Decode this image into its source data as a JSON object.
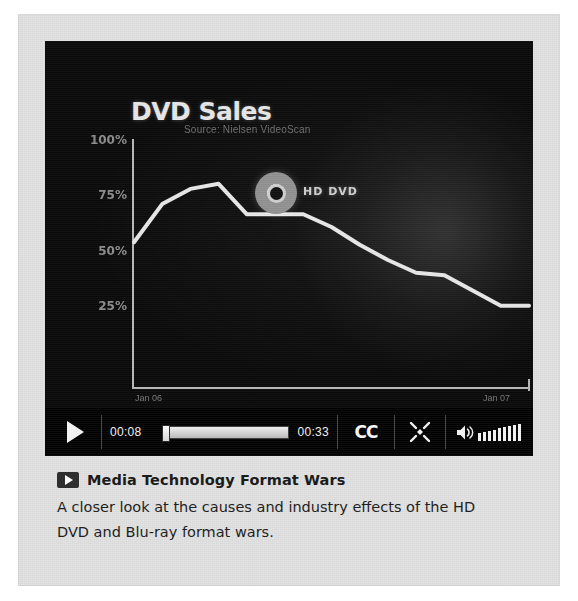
{
  "player": {
    "chart": {
      "title": "DVD Sales",
      "subtitle": "Source: Nielsen VideoScan",
      "annotation_label": "HD DVD"
    },
    "controls": {
      "play_label": "play-button",
      "current_time": "00:08",
      "duration": "00:33",
      "cc_label": "CC",
      "fullscreen_label": "fullscreen-button",
      "volume_label": "volume-control",
      "volume_level_bars": 9,
      "progress_percent": 24
    }
  },
  "caption": {
    "title": "Media Technology Format Wars",
    "description": "A closer look at the causes and industry effects of the HD DVD and Blu-ray format wars."
  },
  "colors": {
    "panel_background": "#e2e2e2",
    "video_background": "#070707",
    "control_bar": "#5a5a5a",
    "series_line": "#e8e8e8",
    "axis": "#b9b9b9",
    "caption_text": "#1f1f1f"
  },
  "chart_data": {
    "type": "line",
    "title": "DVD Sales",
    "subtitle": "Source: Nielsen VideoScan",
    "xlabel": "",
    "ylabel": "",
    "ylim": [
      0,
      100
    ],
    "grid": false,
    "legend": "none",
    "ytick_labels": [
      "100%",
      "75%",
      "50%",
      "25%"
    ],
    "ytick_values": [
      100,
      75,
      50,
      25
    ],
    "xtick_labels": [
      "Jan 06",
      "Jan 07"
    ],
    "annotations": [
      {
        "text": "HD DVD",
        "x_index": 4,
        "value": 70
      }
    ],
    "series": [
      {
        "name": "DVD Sales",
        "x": [
          0,
          1,
          2,
          3,
          4,
          5,
          6,
          7,
          8,
          9,
          10,
          11,
          12,
          13,
          14
        ],
        "values": [
          57,
          72,
          78,
          80,
          68,
          68,
          68,
          63,
          56,
          50,
          45,
          44,
          38,
          32,
          32
        ]
      }
    ]
  }
}
